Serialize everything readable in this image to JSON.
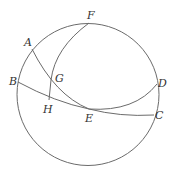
{
  "diagram": {
    "type": "spherical-geometry",
    "circle": {
      "cx": 88,
      "cy": 94.5,
      "r": 71
    },
    "points": [
      {
        "id": "A",
        "label": "A",
        "x": 32,
        "y": 49,
        "lx": 24,
        "ly": 46
      },
      {
        "id": "B",
        "label": "B",
        "x": 18,
        "y": 82,
        "lx": 9,
        "ly": 85
      },
      {
        "id": "C",
        "label": "C",
        "x": 154,
        "y": 115,
        "lx": 155,
        "ly": 119
      },
      {
        "id": "D",
        "label": "D",
        "x": 157,
        "y": 84,
        "lx": 158,
        "ly": 87
      },
      {
        "id": "E",
        "label": "E",
        "x": 89,
        "y": 109,
        "lx": 85,
        "ly": 122
      },
      {
        "id": "F",
        "label": "F",
        "x": 89,
        "y": 23,
        "lx": 87,
        "ly": 19
      },
      {
        "id": "G",
        "label": "G",
        "x": 52,
        "y": 79,
        "lx": 55,
        "ly": 82
      },
      {
        "id": "H",
        "label": "H",
        "x": 49,
        "y": 100,
        "lx": 43,
        "ly": 113
      }
    ],
    "arcs": [
      {
        "id": "arc-AC",
        "through": [
          "A",
          "G",
          "E",
          "C"
        ]
      },
      {
        "id": "arc-BD",
        "through": [
          "B",
          "H",
          "E",
          "D"
        ]
      },
      {
        "id": "arc-FH",
        "through": [
          "F",
          "G",
          "H"
        ]
      }
    ],
    "stroke_color": "#6b6b6b",
    "label_color": "#333333"
  }
}
